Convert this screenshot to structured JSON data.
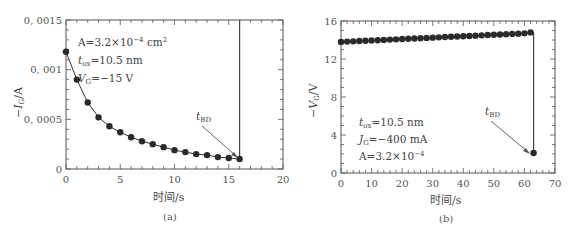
{
  "chart_data": [
    {
      "id": "a",
      "type": "line",
      "caption": "(a)",
      "xlabel": "时间/s",
      "ylabel": "−I_G/A",
      "xlim": [
        0,
        20
      ],
      "ylim": [
        0,
        0.0015
      ],
      "xticks": [
        "0",
        "5",
        "10",
        "15",
        "20"
      ],
      "yticks": [
        "0",
        "0.0005",
        "0.001",
        "0.0015"
      ],
      "grid": false,
      "annotations": {
        "params": [
          "A=3.2×10⁻⁴ cm²",
          "t_ox=10.5 nm",
          "V_G=−15 V"
        ],
        "breakdown_label": "t_BD",
        "breakdown_time": 16
      },
      "x": [
        0,
        1,
        2,
        3,
        4,
        5,
        6,
        7,
        8,
        9,
        10,
        11,
        12,
        13,
        14,
        15,
        16
      ],
      "values": [
        0.00118,
        0.0009,
        0.00067,
        0.00052,
        0.00043,
        0.00037,
        0.00032,
        0.00028,
        0.00025,
        0.00022,
        0.00019,
        0.00017,
        0.00015,
        0.00014,
        0.00012,
        0.00011,
        0.0001
      ]
    },
    {
      "id": "b",
      "type": "line",
      "caption": "(b)",
      "xlabel": "时间/s",
      "ylabel": "−V_G/V",
      "xlim": [
        0,
        70
      ],
      "ylim": [
        0,
        16
      ],
      "xticks": [
        "0",
        "10",
        "20",
        "30",
        "40",
        "50",
        "60",
        "70"
      ],
      "yticks": [
        "0",
        "4",
        "8",
        "12",
        "16"
      ],
      "grid": false,
      "annotations": {
        "params": [
          "t_ox=10.5 nm",
          "J_G=−400 mA",
          "A=3.2×10⁻⁴"
        ],
        "breakdown_label": "t_BD",
        "breakdown_time": 63
      },
      "x": [
        0,
        2,
        4,
        6,
        8,
        10,
        12,
        14,
        16,
        18,
        20,
        22,
        24,
        26,
        28,
        30,
        32,
        34,
        36,
        38,
        40,
        42,
        44,
        46,
        48,
        50,
        52,
        54,
        56,
        58,
        60,
        62,
        63
      ],
      "values": [
        13.8,
        13.83,
        13.86,
        13.89,
        13.92,
        13.95,
        13.98,
        14.01,
        14.04,
        14.07,
        14.1,
        14.13,
        14.16,
        14.19,
        14.22,
        14.25,
        14.28,
        14.31,
        14.34,
        14.37,
        14.4,
        14.43,
        14.46,
        14.49,
        14.52,
        14.55,
        14.58,
        14.61,
        14.64,
        14.67,
        14.7,
        14.8,
        2.1
      ]
    }
  ],
  "captions": {
    "a": "(a)",
    "b": "(b)"
  },
  "labels": {
    "a_x": "时间/s",
    "b_x": "时间/s",
    "tbd": "BD"
  }
}
